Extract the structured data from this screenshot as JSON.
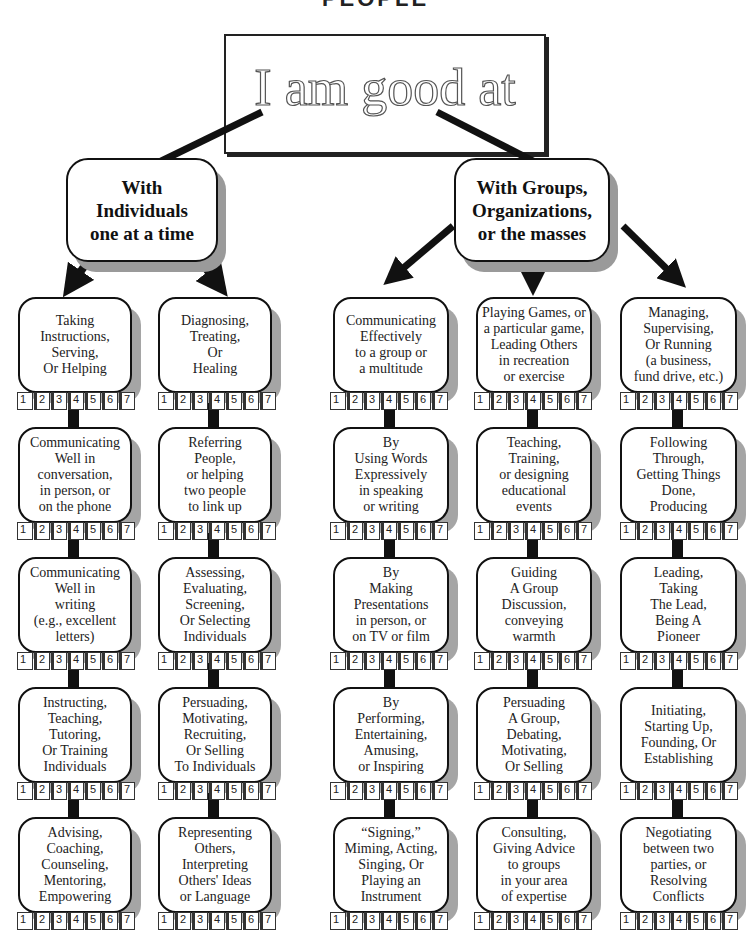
{
  "header": {
    "page_heading": "PEOPLE",
    "root_title": "I am good at"
  },
  "categories": [
    {
      "label": "With\nIndividuals\none at a time"
    },
    {
      "label": "With Groups,\nOrganizations,\nor the masses"
    }
  ],
  "rating_scale": [
    "1",
    "2",
    "3",
    "4",
    "5",
    "6",
    "7"
  ],
  "columns": [
    {
      "category": "With Individuals one at a time",
      "skills": [
        "Taking\nInstructions,\nServing,\nOr Helping",
        "Communicating\nWell in\nconversation,\nin person, or\non the phone",
        "Communicating\nWell in\nwriting\n(e.g., excellent\nletters)",
        "Instructing,\nTeaching,\nTutoring,\nOr Training\nIndividuals",
        "Advising,\nCoaching,\nCounseling,\nMentoring,\nEmpowering"
      ]
    },
    {
      "category": "With Individuals one at a time",
      "skills": [
        "Diagnosing,\nTreating,\nOr\nHealing",
        "Referring\nPeople,\nor helping\ntwo people\nto link up",
        "Assessing,\nEvaluating,\nScreening,\nOr Selecting\nIndividuals",
        "Persuading,\nMotivating,\nRecruiting,\nOr Selling\nTo Individuals",
        "Representing\nOthers,\nInterpreting\nOthers' Ideas\nor Language"
      ]
    },
    {
      "category": "With Groups, Organizations, or the masses",
      "skills": [
        "Communicating\nEffectively\nto a group or\na multitude",
        "By\nUsing Words\nExpressively\nin speaking\nor writing",
        "By\nMaking\nPresentations\nin person, or\non TV or film",
        "By\nPerforming,\nEntertaining,\nAmusing,\nor Inspiring",
        "“Signing,”\nMiming, Acting,\nSinging, Or\nPlaying an\nInstrument"
      ]
    },
    {
      "category": "With Groups, Organizations, or the masses",
      "skills": [
        "Playing Games, or\na particular game,\nLeading Others\nin recreation\nor exercise",
        "Teaching,\nTraining,\nor designing\neducational\nevents",
        "Guiding\nA Group\nDiscussion,\nconveying\nwarmth",
        "Persuading\nA Group,\nDebating,\nMotivating,\nOr Selling",
        "Consulting,\nGiving Advice\nto groups\nin your area\nof expertise"
      ]
    },
    {
      "category": "With Groups, Organizations, or the masses",
      "skills": [
        "Managing,\nSupervising,\nOr Running\n(a business,\nfund drive, etc.)",
        "Following\nThrough,\nGetting Things\nDone,\nProducing",
        "Leading,\nTaking\nThe Lead,\nBeing A\nPioneer",
        "Initiating,\nStarting Up,\nFounding, Or\nEstablishing",
        "Negotiating\nbetween two\nparties, or\nResolving\nConflicts"
      ]
    }
  ],
  "colors": {
    "ink": "#111111",
    "shadow": "#a5a5a5",
    "background": "#ffffff"
  }
}
